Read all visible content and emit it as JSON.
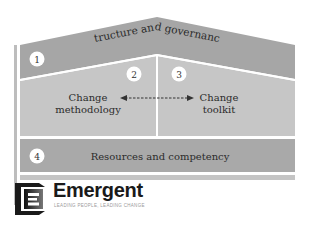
{
  "diagram": {
    "sections": [
      {
        "number": "1",
        "label": "Structure and governance"
      },
      {
        "number": "2",
        "label_line1": "Change",
        "label_line2": "methodology"
      },
      {
        "number": "3",
        "label_line1": "Change",
        "label_line2": "toolkit"
      },
      {
        "number": "4",
        "label": "Resources and competency"
      }
    ],
    "connector": "bidirectional-dashed-arrow",
    "colors": {
      "roof": "#a6a6a6",
      "body": "#c4c4c4",
      "band": "#a8a8a8",
      "frame": "#b8b8b8",
      "divider": "#ffffff"
    }
  },
  "logo": {
    "name": "Emergent",
    "tagline": "LEADING PEOPLE, LEADING CHANGE"
  }
}
